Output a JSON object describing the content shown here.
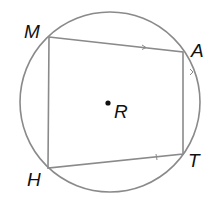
{
  "diagram": {
    "type": "inscribed-quadrilateral",
    "circle": {
      "cx": 110,
      "cy": 102,
      "r": 90,
      "stroke": "#8a8a8a"
    },
    "center": {
      "label": "R",
      "x": 108,
      "y": 102
    },
    "vertices": [
      {
        "label": "M",
        "x": 49,
        "y": 37
      },
      {
        "label": "A",
        "x": 183,
        "y": 52
      },
      {
        "label": "T",
        "x": 183,
        "y": 154
      },
      {
        "label": "H",
        "x": 48,
        "y": 168
      }
    ],
    "sides": [
      "MA",
      "AT",
      "TH",
      "HM"
    ],
    "marks": [
      "arrow on MA",
      "arrow on AT",
      "tick on HT"
    ]
  }
}
